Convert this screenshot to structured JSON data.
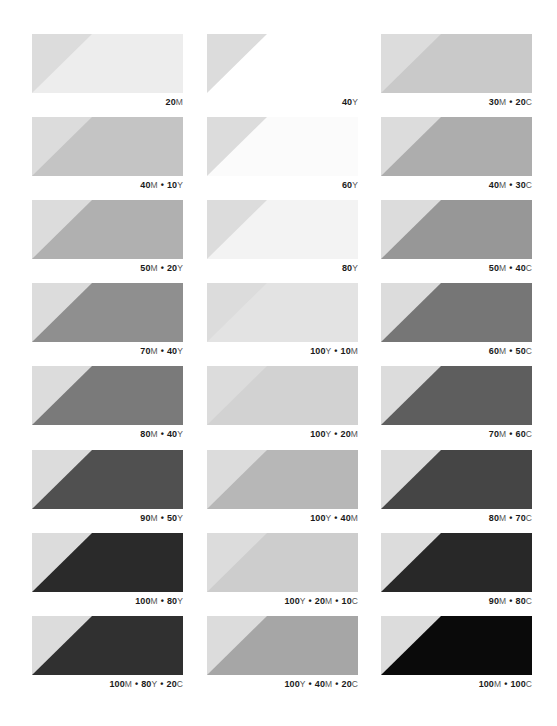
{
  "chart_data": {
    "type": "table",
    "title": "",
    "reference_triangle_color": "#dcdcdc",
    "columns": [
      {
        "swatches": [
          {
            "label": "20M",
            "parts": [
              {
                "n": "20",
                "ink": "M"
              }
            ],
            "fill": "#ededed"
          },
          {
            "label": "40M • 10Y",
            "parts": [
              {
                "n": "40",
                "ink": "M"
              },
              {
                "n": "10",
                "ink": "Y"
              }
            ],
            "fill": "#c4c4c4"
          },
          {
            "label": "50M • 20Y",
            "parts": [
              {
                "n": "50",
                "ink": "M"
              },
              {
                "n": "20",
                "ink": "Y"
              }
            ],
            "fill": "#b0b0b0"
          },
          {
            "label": "70M • 40Y",
            "parts": [
              {
                "n": "70",
                "ink": "M"
              },
              {
                "n": "40",
                "ink": "Y"
              }
            ],
            "fill": "#8f8f8f"
          },
          {
            "label": "80M • 40Y",
            "parts": [
              {
                "n": "80",
                "ink": "M"
              },
              {
                "n": "40",
                "ink": "Y"
              }
            ],
            "fill": "#7a7a7a"
          },
          {
            "label": "90M • 50Y",
            "parts": [
              {
                "n": "90",
                "ink": "M"
              },
              {
                "n": "50",
                "ink": "Y"
              }
            ],
            "fill": "#505050"
          },
          {
            "label": "100M • 80Y",
            "parts": [
              {
                "n": "100",
                "ink": "M"
              },
              {
                "n": "80",
                "ink": "Y"
              }
            ],
            "fill": "#2a2a2a"
          },
          {
            "label": "100M • 80Y • 20C",
            "parts": [
              {
                "n": "100",
                "ink": "M"
              },
              {
                "n": "80",
                "ink": "Y"
              },
              {
                "n": "20",
                "ink": "C"
              }
            ],
            "fill": "#303030"
          }
        ]
      },
      {
        "swatches": [
          {
            "label": "40Y",
            "parts": [
              {
                "n": "40",
                "ink": "Y"
              }
            ],
            "fill": "#ffffff"
          },
          {
            "label": "60Y",
            "parts": [
              {
                "n": "60",
                "ink": "Y"
              }
            ],
            "fill": "#fbfbfb"
          },
          {
            "label": "80Y",
            "parts": [
              {
                "n": "80",
                "ink": "Y"
              }
            ],
            "fill": "#f3f3f3"
          },
          {
            "label": "100Y • 10M",
            "parts": [
              {
                "n": "100",
                "ink": "Y"
              },
              {
                "n": "10",
                "ink": "M"
              }
            ],
            "fill": "#e3e3e3"
          },
          {
            "label": "100Y • 20M",
            "parts": [
              {
                "n": "100",
                "ink": "Y"
              },
              {
                "n": "20",
                "ink": "M"
              }
            ],
            "fill": "#d2d2d2"
          },
          {
            "label": "100Y • 40M",
            "parts": [
              {
                "n": "100",
                "ink": "Y"
              },
              {
                "n": "40",
                "ink": "M"
              }
            ],
            "fill": "#b7b7b7"
          },
          {
            "label": "100Y • 20M • 10C",
            "parts": [
              {
                "n": "100",
                "ink": "Y"
              },
              {
                "n": "20",
                "ink": "M"
              },
              {
                "n": "10",
                "ink": "C"
              }
            ],
            "fill": "#cdcdcd"
          },
          {
            "label": "100Y • 40M • 20C",
            "parts": [
              {
                "n": "100",
                "ink": "Y"
              },
              {
                "n": "40",
                "ink": "M"
              },
              {
                "n": "20",
                "ink": "C"
              }
            ],
            "fill": "#a6a6a6"
          }
        ]
      },
      {
        "swatches": [
          {
            "label": "30M • 20C",
            "parts": [
              {
                "n": "30",
                "ink": "M"
              },
              {
                "n": "20",
                "ink": "C"
              }
            ],
            "fill": "#c9c9c9"
          },
          {
            "label": "40M • 30C",
            "parts": [
              {
                "n": "40",
                "ink": "M"
              },
              {
                "n": "30",
                "ink": "C"
              }
            ],
            "fill": "#adadad"
          },
          {
            "label": "50M • 40C",
            "parts": [
              {
                "n": "50",
                "ink": "M"
              },
              {
                "n": "40",
                "ink": "C"
              }
            ],
            "fill": "#979797"
          },
          {
            "label": "60M • 50C",
            "parts": [
              {
                "n": "60",
                "ink": "M"
              },
              {
                "n": "50",
                "ink": "C"
              }
            ],
            "fill": "#767676"
          },
          {
            "label": "70M • 60C",
            "parts": [
              {
                "n": "70",
                "ink": "M"
              },
              {
                "n": "60",
                "ink": "C"
              }
            ],
            "fill": "#5e5e5e"
          },
          {
            "label": "80M • 70C",
            "parts": [
              {
                "n": "80",
                "ink": "M"
              },
              {
                "n": "70",
                "ink": "C"
              }
            ],
            "fill": "#454545"
          },
          {
            "label": "90M • 80C",
            "parts": [
              {
                "n": "90",
                "ink": "M"
              },
              {
                "n": "80",
                "ink": "C"
              }
            ],
            "fill": "#282828"
          },
          {
            "label": "100M • 100C",
            "parts": [
              {
                "n": "100",
                "ink": "M"
              },
              {
                "n": "100",
                "ink": "C"
              }
            ],
            "fill": "#0a0a0a"
          }
        ]
      }
    ]
  },
  "layout": {
    "col_x": [
      32,
      207,
      381
    ],
    "row_y": [
      34,
      117,
      200,
      283,
      366,
      450,
      533,
      616
    ],
    "separator": "•"
  }
}
